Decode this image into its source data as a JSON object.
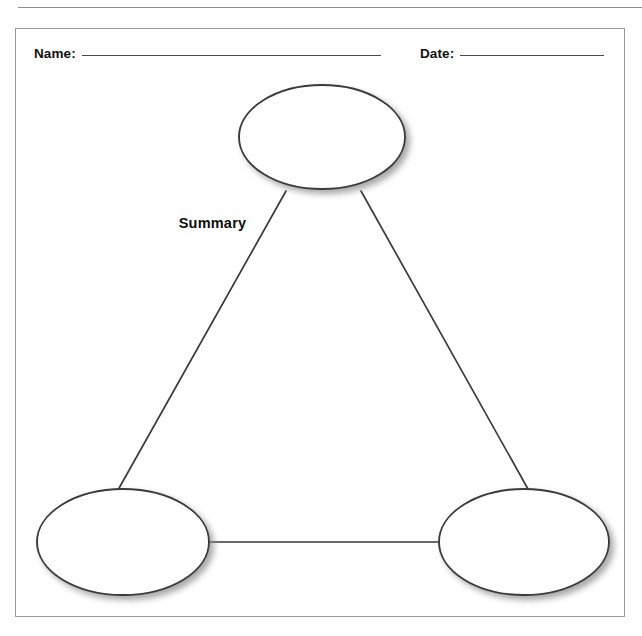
{
  "page": {
    "header_remnant": "",
    "background_color": "#ffffff"
  },
  "worksheet": {
    "border_color": "#9a9a9a",
    "fields": [
      {
        "label": "Name:",
        "value": "",
        "rule_width": 299
      },
      {
        "label": "Date:",
        "value": "",
        "rule_width": 144
      }
    ]
  },
  "diagram": {
    "type": "triangle-summary-organizer",
    "stroke_color": "#3a3a3a",
    "fill_color": "#ffffff",
    "caption": "Summary",
    "nodes": [
      {
        "id": "top",
        "label": "",
        "cx": 321,
        "cy": 136,
        "rx": 83,
        "ry": 52
      },
      {
        "id": "bottom-left",
        "label": "",
        "cx": 122,
        "cy": 541,
        "rx": 86,
        "ry": 53
      },
      {
        "id": "bottom-right",
        "label": "",
        "cx": 523,
        "cy": 541,
        "rx": 85,
        "ry": 53
      }
    ],
    "connectors": [
      {
        "from": "top",
        "to": "bottom-left",
        "kind": "line"
      },
      {
        "from": "top",
        "to": "bottom-right",
        "kind": "line"
      },
      {
        "from": "bottom-left",
        "to": "bottom-right",
        "kind": "line"
      }
    ]
  }
}
